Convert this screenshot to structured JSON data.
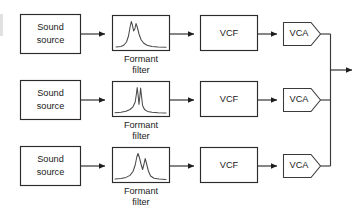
{
  "diagram": {
    "type": "block-diagram",
    "background_color": "#ffffff",
    "line_color": "#2b2b2b",
    "text_color": "#1a1a1a",
    "channel_count": 3,
    "labels": {
      "sound_source_line1": "Sound",
      "sound_source_line2": "source",
      "formant_caption_line1": "Formant",
      "formant_caption_line2": "filter",
      "vcf": "VCF",
      "vca": "VCA"
    },
    "rows": [
      {
        "id": "channel-1",
        "source_label_line1": "Sound",
        "source_label_line2": "source",
        "filter_caption_line1": "Formant",
        "filter_caption_line2": "filter",
        "vcf_label": "VCF",
        "vca_label": "VCA",
        "spectrum_description": "two formant peaks, first tall and narrow, second slightly lower, long decaying tail"
      },
      {
        "id": "channel-2",
        "source_label_line1": "Sound",
        "source_label_line2": "source",
        "filter_caption_line1": "Formant",
        "filter_caption_line2": "filter",
        "vcf_label": "VCF",
        "vca_label": "VCA",
        "spectrum_description": "two very narrow high-Q spikes side by side at centre, broad low skirts"
      },
      {
        "id": "channel-3",
        "source_label_line1": "Sound",
        "source_label_line2": "source",
        "filter_caption_line1": "Formant",
        "filter_caption_line2": "filter",
        "vcf_label": "VCF",
        "vca_label": "VCA",
        "spectrum_description": "one tall rounded peak followed by a shorter narrow peak, short tail"
      }
    ],
    "output": {
      "has_summing_bus": true,
      "bus_position": "right",
      "output_arrow_label": ""
    }
  }
}
